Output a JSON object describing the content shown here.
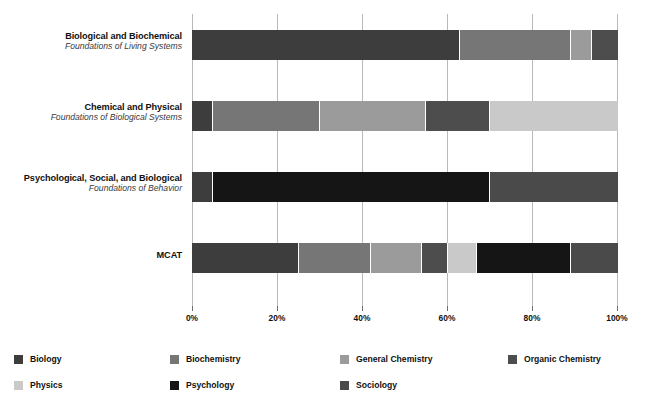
{
  "chart_data": {
    "type": "bar",
    "orientation": "horizontal",
    "stacked": true,
    "stack_mode": "percent",
    "title": "",
    "subtitle": "",
    "xlabel": "",
    "ylabel": "",
    "xlim": [
      0,
      100
    ],
    "xticks": [
      0,
      20,
      40,
      60,
      80,
      100
    ],
    "xtick_labels": [
      "0%",
      "20%",
      "40%",
      "60%",
      "80%",
      "100%"
    ],
    "grid": true,
    "grid_axis": "x",
    "legend_position": "bottom",
    "categories": [
      "Biological and Biochemical Foundations of Living Systems",
      "Chemical and Physical Foundations of Biological Systems",
      "Psychological, Social, and Biological Foundations of Behavior",
      "MCAT"
    ],
    "category_labels": [
      {
        "line1": "Biological and Biochemical",
        "line2": "Foundations of Living Systems"
      },
      {
        "line1": "Chemical and Physical",
        "line2": "Foundations of Biological Systems"
      },
      {
        "line1": "Psychological, Social, and Biological",
        "line2": "Foundations of Behavior"
      },
      {
        "line1": "MCAT",
        "line2": ""
      }
    ],
    "series": [
      {
        "name": "Biology",
        "color": "#3d3d3d",
        "values": [
          65,
          5,
          5,
          25
        ]
      },
      {
        "name": "Biochemistry",
        "color": "#767676",
        "values": [
          25,
          25,
          0,
          15
        ]
      },
      {
        "name": "General Chemistry",
        "color": "#9b9b9b",
        "values": [
          0,
          30,
          0,
          12
        ]
      },
      {
        "name": "Organic Chemistry",
        "color": "#4d4d4d",
        "values": [
          5,
          15,
          0,
          6
        ]
      },
      {
        "name": "Physics",
        "color": "#c9c9c9",
        "values": [
          0,
          25,
          0,
          7
        ]
      },
      {
        "name": "Psychology",
        "color": "#151515",
        "values": [
          0,
          0,
          65,
          25
        ]
      },
      {
        "name": "Sociology",
        "color": "#4a4a4a",
        "values": [
          5,
          0,
          25,
          10
        ]
      }
    ],
    "rows": [
      {
        "label_line1": "Biological and Biochemical",
        "label_line2": "Foundations of Living Systems",
        "segments": [
          {
            "name": "Biology",
            "value": 63,
            "color": "#3d3d3d"
          },
          {
            "name": "Biochemistry",
            "value": 26,
            "color": "#767676"
          },
          {
            "name": "General Chemistry",
            "value": 5,
            "color": "#9b9b9b"
          },
          {
            "name": "Organic Chemistry",
            "value": 6,
            "color": "#4d4d4d"
          }
        ]
      },
      {
        "label_line1": "Chemical and Physical",
        "label_line2": "Foundations of Biological Systems",
        "segments": [
          {
            "name": "Biology",
            "value": 5,
            "color": "#3d3d3d"
          },
          {
            "name": "Biochemistry",
            "value": 25,
            "color": "#767676"
          },
          {
            "name": "General Chemistry",
            "value": 25,
            "color": "#9b9b9b"
          },
          {
            "name": "Organic Chemistry",
            "value": 15,
            "color": "#4d4d4d"
          },
          {
            "name": "Physics",
            "value": 30,
            "color": "#c9c9c9"
          }
        ]
      },
      {
        "label_line1": "Psychological, Social, and Biological",
        "label_line2": "Foundations of Behavior",
        "segments": [
          {
            "name": "Biology",
            "value": 5,
            "color": "#3d3d3d"
          },
          {
            "name": "Psychology",
            "value": 65,
            "color": "#151515"
          },
          {
            "name": "Sociology",
            "value": 30,
            "color": "#4a4a4a"
          }
        ]
      },
      {
        "label_line1": "MCAT",
        "label_line2": "",
        "segments": [
          {
            "name": "Biology",
            "value": 25,
            "color": "#3d3d3d"
          },
          {
            "name": "Biochemistry",
            "value": 17,
            "color": "#767676"
          },
          {
            "name": "General Chemistry",
            "value": 12,
            "color": "#9b9b9b"
          },
          {
            "name": "Organic Chemistry",
            "value": 6,
            "color": "#4d4d4d"
          },
          {
            "name": "Physics",
            "value": 7,
            "color": "#c9c9c9"
          },
          {
            "name": "Psychology",
            "value": 22,
            "color": "#151515"
          },
          {
            "name": "Sociology",
            "value": 11,
            "color": "#4a4a4a"
          }
        ]
      }
    ],
    "legend": [
      {
        "label": "Biology",
        "color": "#3d3d3d"
      },
      {
        "label": "Biochemistry",
        "color": "#767676"
      },
      {
        "label": "General Chemistry",
        "color": "#9b9b9b"
      },
      {
        "label": "Organic Chemistry",
        "color": "#4d4d4d"
      },
      {
        "label": "Physics",
        "color": "#c9c9c9"
      },
      {
        "label": "Psychology",
        "color": "#151515"
      },
      {
        "label": "Sociology",
        "color": "#4a4a4a"
      }
    ]
  }
}
